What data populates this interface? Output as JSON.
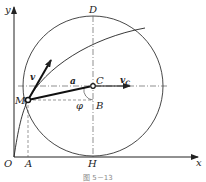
{
  "figure": {
    "caption": "图 5－13",
    "labels": {
      "y_axis": "y",
      "x_axis": "x",
      "origin": "O",
      "point_A": "A",
      "point_H": "H",
      "point_D": "D",
      "point_C": "C",
      "point_B": "B",
      "point_M": "M",
      "velocity_v": "v",
      "acceleration_a": "a",
      "velocity_C": "v",
      "velocity_C_sub": "C",
      "angle_phi": "φ"
    },
    "colors": {
      "line": "#222222",
      "background": "#ffffff"
    }
  }
}
